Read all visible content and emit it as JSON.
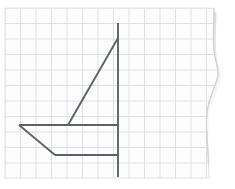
{
  "document": {
    "kind": "scanned-graph-paper-drawing",
    "title": "Sailboat on grid paper",
    "width": 235,
    "height": 189,
    "background_color": "#ffffff"
  },
  "paper": {
    "name": "grid-paper-sheet",
    "fill_color": "#fdfdfd",
    "border_color": "#e2e2e2",
    "shadow_color": "#c9c9c9",
    "left": 5,
    "top": 8,
    "right": 214,
    "bottom": 178,
    "torn_edge": {
      "present": true,
      "description": "wavy torn right edge bulging outward near vertical middle",
      "points": "214,8 213,46 216,62 219,74 214,88 208,104 206,122 208,150 209,178"
    }
  },
  "grid": {
    "name": "graph-grid",
    "line_color": "#d9dee4",
    "line_width": 0.9,
    "spacing": 15.5,
    "origin_x": 5,
    "origin_y": 8,
    "columns": 13,
    "rows": 11,
    "visible": true
  },
  "drawing": {
    "name": "sailboat-figure",
    "stroke_color": "#5e636a",
    "stroke_width": 1.9,
    "line_cap": "butt",
    "segments": [
      {
        "name": "mast-line",
        "role": "vertical mast",
        "x1": 118,
        "y1": 23,
        "x2": 118,
        "y2": 177
      },
      {
        "name": "sail-hypotenuse-line",
        "role": "diagonal sail edge from mast down-left to boom",
        "x1": 118,
        "y1": 38,
        "x2": 68,
        "y2": 125
      },
      {
        "name": "boom-deck-line",
        "role": "upper horizontal deck / boom",
        "x1": 19,
        "y1": 125,
        "x2": 118,
        "y2": 125
      },
      {
        "name": "hull-slant-line",
        "role": "angled bow of hull",
        "x1": 19,
        "y1": 125,
        "x2": 55,
        "y2": 155
      },
      {
        "name": "hull-bottom-line",
        "role": "lower horizontal hull bottom",
        "x1": 55,
        "y1": 155,
        "x2": 118,
        "y2": 155
      }
    ]
  },
  "chart_data": {
    "type": "line",
    "xlabel": "",
    "ylabel": "",
    "grid": true,
    "legend": "none",
    "xlim": [
      0,
      13
    ],
    "ylim": [
      0,
      11
    ],
    "grid_units": {
      "cell_px": 15.5,
      "origin_px": [
        5,
        8
      ]
    },
    "series": [
      {
        "name": "mast",
        "x": [
          7.3,
          7.3
        ],
        "y": [
          10.0,
          0.06
        ]
      },
      {
        "name": "sail-diagonal",
        "x": [
          7.3,
          4.06
        ],
        "y": [
          9.03,
          3.45
        ]
      },
      {
        "name": "deck-boom",
        "x": [
          0.9,
          7.3
        ],
        "y": [
          3.45,
          3.45
        ]
      },
      {
        "name": "hull-bow-slant",
        "x": [
          0.9,
          3.23
        ],
        "y": [
          3.45,
          1.48
        ]
      },
      {
        "name": "hull-bottom",
        "x": [
          3.23,
          7.3
        ],
        "y": [
          1.48,
          1.48
        ]
      }
    ]
  }
}
